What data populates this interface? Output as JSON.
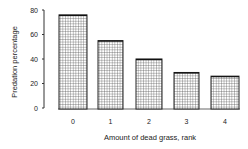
{
  "chart_data": {
    "type": "bar",
    "title": "",
    "xlabel": "Amount of dead grass, rank",
    "ylabel": "Predation percentage",
    "categories": [
      "0",
      "1",
      "2",
      "3",
      "4"
    ],
    "values": [
      76,
      55,
      40,
      29,
      26
    ],
    "ylim": [
      0,
      80
    ],
    "yticks": [
      "0",
      "20",
      "40",
      "60",
      "80"
    ],
    "grid": false,
    "legend": null,
    "bar_fill": "crosshatch grid pattern",
    "colors": {
      "bar_stroke": "#222222",
      "hatch": "#555555",
      "background": "#ffffff"
    }
  }
}
